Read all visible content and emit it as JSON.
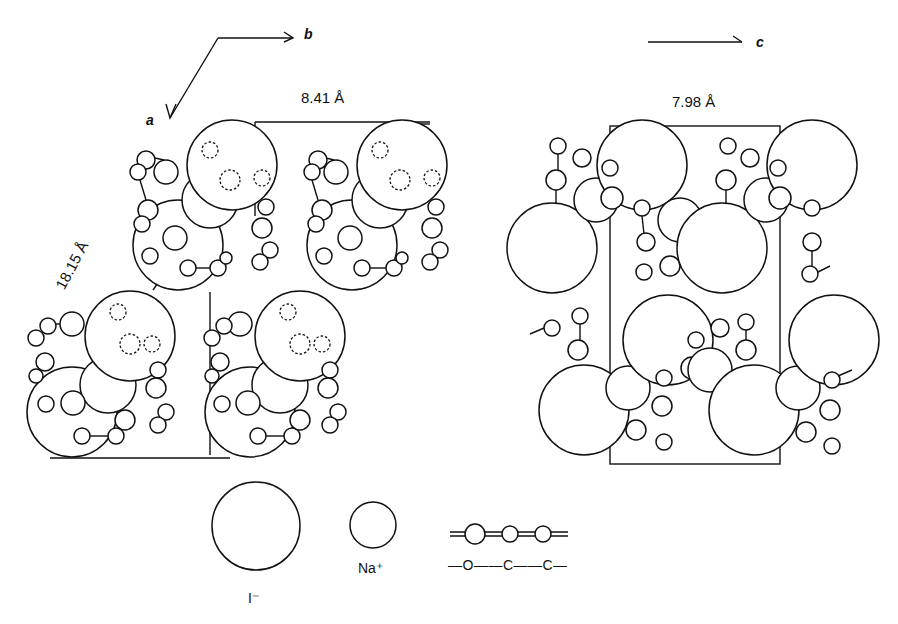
{
  "figure": {
    "left_panel": {
      "axis_a_label": "a",
      "axis_b_label": "b",
      "cell_edge_b": "8.41 Å",
      "cell_edge_a": "18.15 Å"
    },
    "right_panel": {
      "axis_c_label": "c",
      "cell_edge_c": "7.98 Å"
    },
    "legend": {
      "items": [
        {
          "symbol": "large-circle",
          "label": "I⁻"
        },
        {
          "symbol": "medium-circle",
          "label": "Na⁺"
        },
        {
          "symbol": "chain",
          "label": "—O——C——C—"
        }
      ]
    },
    "colors": {
      "ink": "#111111",
      "background": "#ffffff"
    }
  }
}
